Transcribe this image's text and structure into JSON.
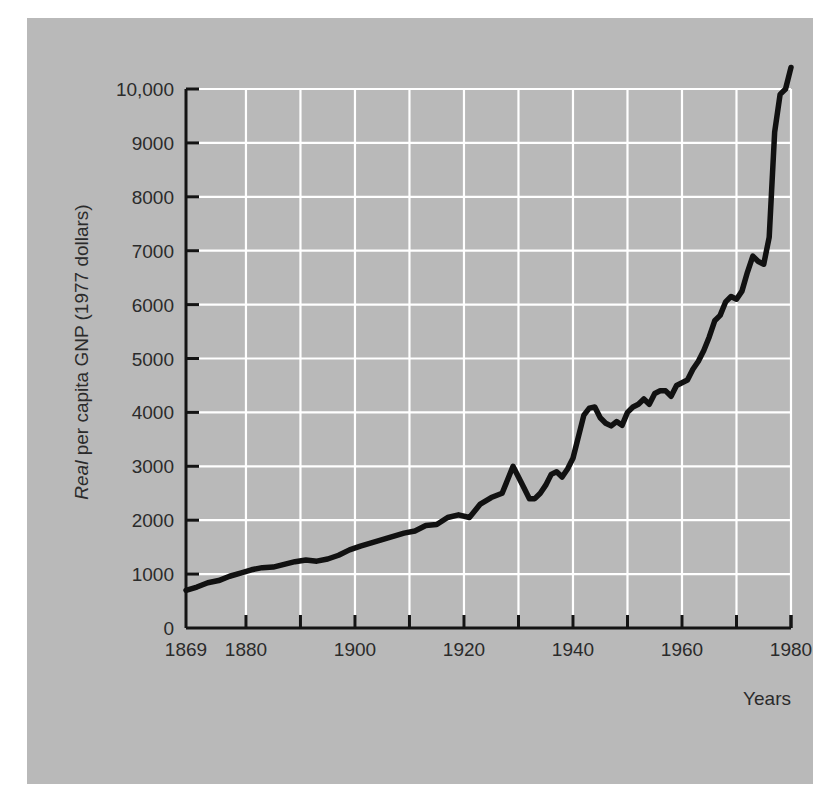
{
  "figure": {
    "background_color": "#ffffff",
    "panel_color": "#b9b9b9",
    "gridline_color": "#ffffff",
    "axis_color": "#1a1a1a",
    "series_color": "#111111"
  },
  "chart_data": {
    "type": "line",
    "title": "",
    "subtitle": "",
    "xlabel": "Years",
    "ylabel": "Real per capita GNP (1977 dollars)",
    "ylabel_parts": [
      {
        "text": "Real",
        "style": "italic"
      },
      {
        "text": " per capita GNP (1977 dollars)",
        "style": "normal"
      }
    ],
    "xlim": [
      1869,
      1980
    ],
    "ylim": [
      0,
      10800
    ],
    "grid": true,
    "legend": "none",
    "x_tick_labels": [
      "1869",
      "1880",
      "1900",
      "1920",
      "1940",
      "1960",
      "1980"
    ],
    "x_tick_values": [
      1869,
      1880,
      1900,
      1920,
      1940,
      1960,
      1980
    ],
    "x_gridline_values": [
      1880,
      1890,
      1900,
      1910,
      1920,
      1930,
      1940,
      1950,
      1960,
      1970,
      1980
    ],
    "y_tick_labels": [
      "0",
      "1000",
      "2000",
      "3000",
      "4000",
      "5000",
      "6000",
      "7000",
      "8000",
      "9000",
      "10,000"
    ],
    "y_tick_values": [
      0,
      1000,
      2000,
      3000,
      4000,
      5000,
      6000,
      7000,
      8000,
      9000,
      10000
    ],
    "y_gridline_values": [
      1000,
      2000,
      3000,
      4000,
      5000,
      6000,
      7000,
      8000,
      9000,
      10000
    ],
    "series": [
      {
        "name": "Real per capita GNP",
        "x": [
          1869,
          1871,
          1873,
          1875,
          1877,
          1879,
          1881,
          1883,
          1885,
          1887,
          1889,
          1891,
          1893,
          1895,
          1897,
          1899,
          1901,
          1903,
          1905,
          1907,
          1909,
          1911,
          1913,
          1915,
          1917,
          1919,
          1921,
          1923,
          1925,
          1927,
          1929,
          1930,
          1931,
          1932,
          1933,
          1934,
          1935,
          1936,
          1937,
          1938,
          1939,
          1940,
          1941,
          1942,
          1943,
          1944,
          1945,
          1946,
          1947,
          1948,
          1949,
          1950,
          1951,
          1952,
          1953,
          1954,
          1955,
          1956,
          1957,
          1958,
          1959,
          1960,
          1961,
          1962,
          1963,
          1964,
          1965,
          1966,
          1967,
          1968,
          1969,
          1970,
          1971,
          1972,
          1973,
          1974,
          1975,
          1976,
          1977,
          1978,
          1979,
          1980
        ],
        "y": [
          700,
          760,
          840,
          880,
          960,
          1020,
          1080,
          1120,
          1130,
          1180,
          1230,
          1260,
          1240,
          1280,
          1350,
          1450,
          1520,
          1580,
          1640,
          1700,
          1760,
          1800,
          1900,
          1920,
          2050,
          2100,
          2050,
          2300,
          2420,
          2500,
          3000,
          2800,
          2600,
          2400,
          2400,
          2500,
          2650,
          2850,
          2900,
          2800,
          2950,
          3150,
          3550,
          3950,
          4080,
          4100,
          3900,
          3800,
          3750,
          3830,
          3760,
          4000,
          4100,
          4150,
          4250,
          4150,
          4350,
          4400,
          4400,
          4300,
          4500,
          4550,
          4600,
          4800,
          4950,
          5150,
          5400,
          5700,
          5800,
          6050,
          6150,
          6100,
          6250,
          6600,
          6900,
          6800,
          6750,
          7250,
          9200,
          9900,
          10000,
          10400
        ]
      }
    ]
  },
  "axis_titles": {
    "x": "Years"
  }
}
